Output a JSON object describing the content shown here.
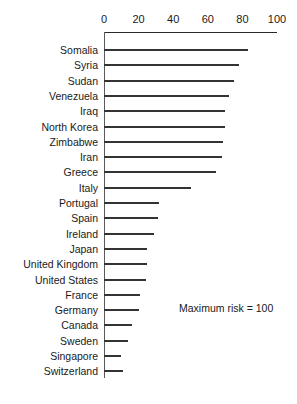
{
  "chart_data": {
    "type": "bar",
    "orientation": "horizontal",
    "title": "",
    "xlabel": "",
    "ylabel": "",
    "xlim": [
      0,
      100
    ],
    "xticks": [
      0,
      20,
      40,
      60,
      80,
      100
    ],
    "xtick_labels": [
      "0",
      "20",
      "40",
      "60",
      "80",
      "100"
    ],
    "grid": false,
    "legend": null,
    "annotation": "Maximum risk = 100",
    "categories": [
      "Somalia",
      "Syria",
      "Sudan",
      "Venezuela",
      "Iraq",
      "North Korea",
      "Zimbabwe",
      "Iran",
      "Greece",
      "Italy",
      "Portugal",
      "Spain",
      "Ireland",
      "Japan",
      "United Kingdom",
      "United States",
      "France",
      "Germany",
      "Canada",
      "Sweden",
      "Singapore",
      "Switzerland"
    ],
    "values": [
      83,
      78,
      75,
      72,
      70,
      70,
      69,
      68,
      65,
      50,
      32,
      31,
      29,
      25,
      25,
      24,
      21,
      20,
      16,
      14,
      10,
      11
    ]
  },
  "style": {
    "bar_color": "#333333",
    "axis_color": "#2b2b2b",
    "text_color": "#1a1a1a",
    "background": "#ffffff"
  }
}
